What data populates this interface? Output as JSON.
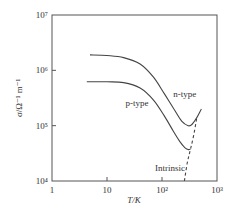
{
  "chart_data": {
    "type": "line",
    "title": "",
    "xlabel": "T/K",
    "ylabel": "σ/Ω⁻¹ m⁻¹",
    "xscale": "log",
    "yscale": "log",
    "xlim": [
      1,
      1000
    ],
    "ylim": [
      10000,
      10000000
    ],
    "grid": false,
    "legend": "inline labels",
    "x_ticks": [
      {
        "value": 1,
        "label": "1"
      },
      {
        "value": 10,
        "label": "10"
      },
      {
        "value": 100,
        "label": "10²"
      },
      {
        "value": 1000,
        "label": "10³"
      }
    ],
    "y_ticks": [
      {
        "value": 10000,
        "label": "10⁴"
      },
      {
        "value": 100000,
        "label": "10⁵"
      },
      {
        "value": 1000000,
        "label": "10⁶"
      },
      {
        "value": 10000000,
        "label": "10⁷"
      }
    ],
    "series": [
      {
        "name": "n-type",
        "style": "solid",
        "points": [
          [
            4.9,
            1900000
          ],
          [
            10,
            1850000
          ],
          [
            20,
            1700000
          ],
          [
            40,
            1300000
          ],
          [
            70,
            750000
          ],
          [
            110,
            380000
          ],
          [
            170,
            190000
          ],
          [
            230,
            120000
          ],
          [
            300,
            100000
          ],
          [
            350,
            105000
          ],
          [
            430,
            140000
          ],
          [
            520,
            200000
          ]
        ]
      },
      {
        "name": "p-type",
        "style": "solid",
        "points": [
          [
            4.3,
            620000
          ],
          [
            10,
            620000
          ],
          [
            20,
            600000
          ],
          [
            40,
            480000
          ],
          [
            70,
            290000
          ],
          [
            110,
            150000
          ],
          [
            160,
            80000
          ],
          [
            210,
            52000
          ],
          [
            260,
            40000
          ],
          [
            300,
            37000
          ],
          [
            330,
            37500
          ]
        ]
      },
      {
        "name": "Intrinsic",
        "style": "dashed",
        "points": [
          [
            255,
            10000
          ],
          [
            290,
            22000
          ],
          [
            330,
            37500
          ],
          [
            380,
            70000
          ],
          [
            430,
            140000
          ]
        ]
      }
    ],
    "annotations": [
      {
        "text": "n-type",
        "x": 260,
        "y": 330000
      },
      {
        "text": "p-type",
        "x": 35,
        "y": 230000
      },
      {
        "text": "Intrinsic",
        "x": 140,
        "y": 15000
      }
    ]
  }
}
